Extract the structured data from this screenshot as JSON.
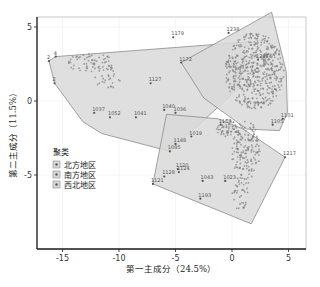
{
  "chart_data": {
    "type": "scatter",
    "title": "",
    "xlabel": "第一主成分（24.5%）",
    "ylabel": "第二主成分（11.5%）",
    "xlim": [
      -17.5,
      6.5
    ],
    "ylim": [
      -10.2,
      6.2
    ],
    "xticks": [
      -15,
      -10,
      -5,
      0,
      5
    ],
    "yticks": [
      -5,
      0,
      5
    ],
    "grid": true,
    "legend_position": "inside-left",
    "legend": {
      "title": "聚类",
      "entries": [
        "北方地区",
        "南方地区",
        "西北地区"
      ]
    },
    "series": [
      {
        "name": "北方地区",
        "hull": [
          [
            -16.2,
            2.7
          ],
          [
            -15.6,
            3.0
          ],
          [
            1.6,
            4.0
          ],
          [
            0.5,
            0.8
          ],
          [
            -5.5,
            -3.4
          ],
          [
            -11.5,
            -2.2
          ],
          [
            -13.2,
            -1.4
          ],
          [
            -15.7,
            1.2
          ],
          [
            -16.2,
            2.7
          ]
        ],
        "labeled_points": [
          {
            "id": "2",
            "x": -16.2,
            "y": 2.7
          },
          {
            "id": "4",
            "x": -15.6,
            "y": 3.0
          },
          {
            "id": "2",
            "x": -15.7,
            "y": 1.2
          },
          {
            "id": "1127",
            "x": -7.2,
            "y": 1.2
          },
          {
            "id": "1037",
            "x": -12.2,
            "y": -0.8
          },
          {
            "id": "1052",
            "x": -10.8,
            "y": -1.1
          },
          {
            "id": "1041",
            "x": -8.5,
            "y": -1.1
          },
          {
            "id": "1179",
            "x": -5.2,
            "y": 4.3
          },
          {
            "id": "1040",
            "x": -6.0,
            "y": -0.6
          },
          {
            "id": "1036",
            "x": -5.0,
            "y": -0.8
          },
          {
            "id": "1095",
            "x": -5.5,
            "y": -3.4
          }
        ]
      },
      {
        "name": "南方地区",
        "hull": [
          [
            -4.5,
            2.6
          ],
          [
            3.5,
            6.0
          ],
          [
            4.8,
            2.0
          ],
          [
            4.9,
            -0.8
          ],
          [
            4.2,
            -2.0
          ],
          [
            1.3,
            -1.9
          ],
          [
            -2.5,
            0.2
          ],
          [
            -4.5,
            2.6
          ]
        ],
        "labeled_points": [
          {
            "id": "1172",
            "x": -4.5,
            "y": 2.6
          },
          {
            "id": "1238",
            "x": -0.3,
            "y": 4.6
          },
          {
            "id": "1101",
            "x": 4.5,
            "y": -1.2
          },
          {
            "id": "1105",
            "x": 3.6,
            "y": -1.6
          },
          {
            "id": "1287",
            "x": 2.3,
            "y": 2.8
          }
        ]
      },
      {
        "name": "西北地区",
        "hull": [
          [
            -5.8,
            -0.9
          ],
          [
            -1.2,
            -1.2
          ],
          [
            1.0,
            -1.9
          ],
          [
            4.7,
            -3.8
          ],
          [
            1.7,
            -8.3
          ],
          [
            -7.0,
            -5.6
          ],
          [
            -5.8,
            -0.9
          ]
        ],
        "labeled_points": [
          {
            "id": "1158",
            "x": -1.0,
            "y": -1.6
          },
          {
            "id": "1148",
            "x": -5.0,
            "y": -2.9
          },
          {
            "id": "1019",
            "x": -3.6,
            "y": -2.4
          },
          {
            "id": "1120",
            "x": -4.8,
            "y": -4.6
          },
          {
            "id": "1124",
            "x": -4.7,
            "y": -4.8
          },
          {
            "id": "1128",
            "x": -6.0,
            "y": -5.1
          },
          {
            "id": "1121",
            "x": -7.0,
            "y": -5.6
          },
          {
            "id": "1043",
            "x": -2.6,
            "y": -5.4
          },
          {
            "id": "1023",
            "x": -0.6,
            "y": -5.4
          },
          {
            "id": "1193",
            "x": -2.8,
            "y": -6.6
          },
          {
            "id": "1217",
            "x": 4.7,
            "y": -3.8
          }
        ]
      }
    ]
  },
  "colors": {
    "hull_fill": "#d9d9d9",
    "hull_stroke": "#8c8c8c",
    "point": "#555555",
    "dense_cluster": "#7f7f7f",
    "axis": "#222222",
    "grid": "#eeeeee"
  }
}
